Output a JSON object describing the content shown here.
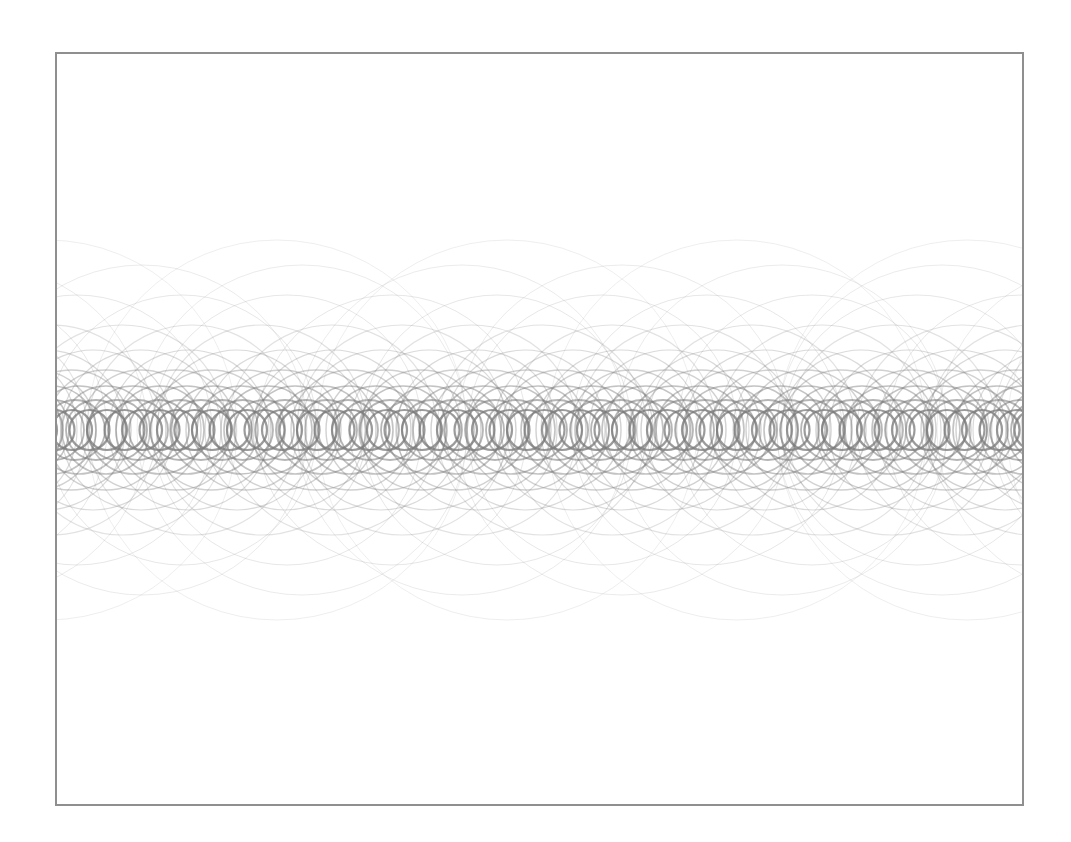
{
  "canvas": {
    "background": "#ffffff",
    "border_color": "#8f8f8f",
    "stroke_color": "#7a7a7a",
    "band_center_y": 376,
    "width": 965,
    "height": 750
  },
  "ring_layers": [
    {
      "radius": 20,
      "spacing": 17.5,
      "offset": 0,
      "opacity": 0.75,
      "width": 2.2
    },
    {
      "radius": 30,
      "spacing": 21,
      "offset": 6,
      "opacity": 0.55,
      "width": 1.8
    },
    {
      "radius": 44,
      "spacing": 27,
      "offset": 12,
      "opacity": 0.45,
      "width": 1.6
    },
    {
      "radius": 60,
      "spacing": 35,
      "offset": 4,
      "opacity": 0.35,
      "width": 1.4
    },
    {
      "radius": 80,
      "spacing": 48,
      "offset": 20,
      "opacity": 0.28,
      "width": 1.2
    },
    {
      "radius": 105,
      "spacing": 70,
      "offset": 30,
      "opacity": 0.22,
      "width": 1.1
    },
    {
      "radius": 135,
      "spacing": 105,
      "offset": 50,
      "opacity": 0.18,
      "width": 1.0
    },
    {
      "radius": 165,
      "spacing": 160,
      "offset": 90,
      "opacity": 0.15,
      "width": 1.0
    },
    {
      "radius": 190,
      "spacing": 230,
      "offset": 180,
      "opacity": 0.13,
      "width": 1.0
    }
  ]
}
